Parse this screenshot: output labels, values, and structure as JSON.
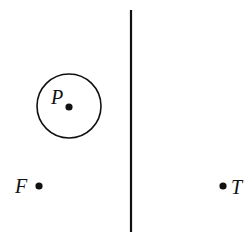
{
  "diagram": {
    "points": [
      {
        "id": "P",
        "label": "P"
      },
      {
        "id": "F",
        "label": "F"
      },
      {
        "id": "T",
        "label": "T"
      }
    ],
    "colors": {
      "stroke": "#111111",
      "background": "#ffffff"
    }
  }
}
